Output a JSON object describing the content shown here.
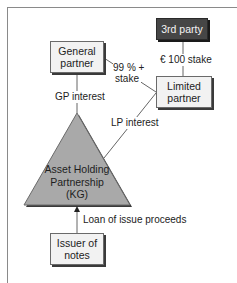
{
  "diagram": {
    "nodes": {
      "general_partner": {
        "label": "General\npartner",
        "line1": "General",
        "line2": "partner"
      },
      "third_party": {
        "label": "3rd party"
      },
      "limited_partner": {
        "label": "Limited\npartner",
        "line1": "Limited",
        "line2": "partner"
      },
      "asset_holding": {
        "line1": "Asset Holding",
        "line2": "Partnership",
        "line3": "(KG)"
      },
      "issuer": {
        "label": "Issuer of\nnotes",
        "line1": "Issuer of",
        "line2": "notes"
      }
    },
    "edges": {
      "gp_to_lp": {
        "line1": "99 % +",
        "line2": "stake"
      },
      "third_to_lp": {
        "label": "€ 100 stake"
      },
      "gp_to_kg": {
        "label": "GP interest"
      },
      "lp_to_kg": {
        "label": "LP interest"
      },
      "issuer_to_kg": {
        "label": "Loan of issue proceeds"
      }
    },
    "colors": {
      "box_fill": "#f2f2f2",
      "dark_box_fill": "#464646",
      "triangle_fill": "#a9a9a9",
      "line": "#666666"
    }
  }
}
